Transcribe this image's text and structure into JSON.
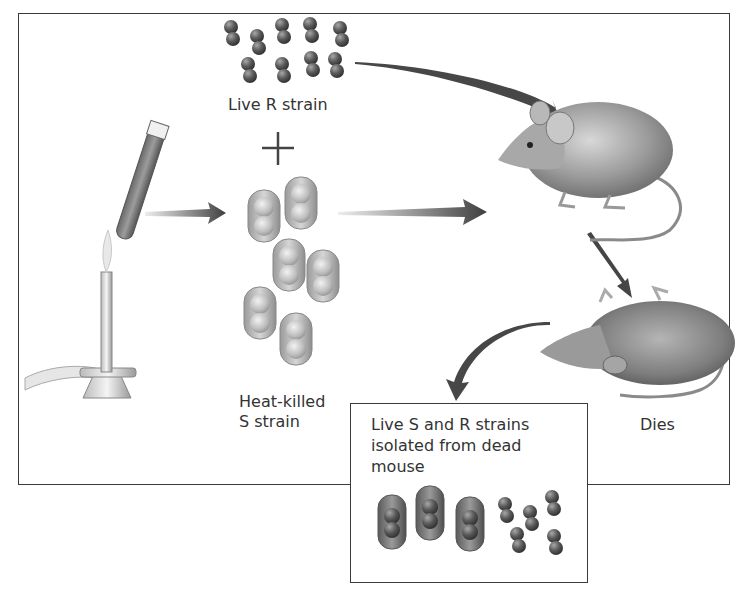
{
  "figure": {
    "labels": {
      "live_r_strain": "Live R strain",
      "plus_sign": "+",
      "heat_killed_line1": "Heat-killed",
      "heat_killed_line2": "S strain",
      "dies": "Dies",
      "result_line1": "Live S and R strains",
      "result_line2": "isolated from dead",
      "result_line3": "mouse"
    },
    "elements": {
      "bunsen_burner": "Bunsen burner heating test tube",
      "live_mouse": "Live mouse",
      "dead_mouse": "Dead mouse on its back",
      "r_strain_cluster_count": 10,
      "s_strain_heat_killed_count": 6,
      "result_s_strain_count": 3,
      "result_r_strain_count": 5
    },
    "colors": {
      "frame": "#3a3a3a",
      "arrow": "#4a4a4a",
      "r_cell": "#5e5e5e",
      "s_capsule_pale": "#c8c8c8",
      "s_capsule_dark": "#7a7a7a",
      "text": "#333333"
    }
  }
}
